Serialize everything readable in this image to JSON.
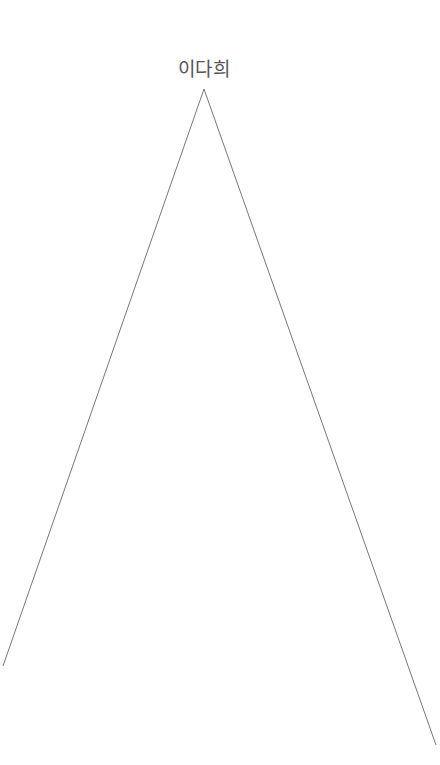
{
  "tree": {
    "root_label": "이다희",
    "line_color": "#777777",
    "edges": [
      {
        "from": [
          204,
          89
        ],
        "to": [
          3,
          666
        ]
      },
      {
        "from": [
          204,
          89
        ],
        "to": [
          436,
          745
        ]
      }
    ]
  }
}
